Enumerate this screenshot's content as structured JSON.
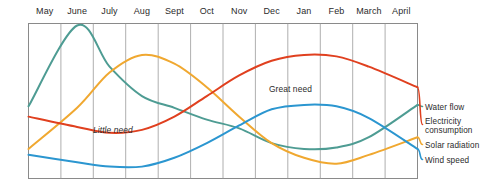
{
  "chart_data": {
    "type": "line",
    "title": "",
    "subtitle": "",
    "xlabel": "",
    "ylabel": "",
    "grid": true,
    "legend_position": "right",
    "axis_ranges": {
      "x": [
        0,
        12
      ],
      "y": [
        0,
        100
      ]
    },
    "categories": [
      "May",
      "June",
      "July",
      "Aug",
      "Sept",
      "Oct",
      "Nov",
      "Dec",
      "Jan",
      "Feb",
      "March",
      "April"
    ],
    "x_tick_labels": [
      "May",
      "June",
      "July",
      "Aug",
      "Sept",
      "Oct",
      "Nov",
      "Dec",
      "Jan",
      "Feb",
      "March",
      "April"
    ],
    "y_tick_labels": [],
    "series": [
      {
        "name": "Water flow",
        "color": "#4e9c93",
        "values": [
          45,
          100,
          72,
          52,
          44,
          36,
          30,
          20,
          16,
          17,
          24,
          46
        ]
      },
      {
        "name": "Electricity consumption",
        "color": "#e0401f",
        "values": [
          38,
          31,
          27,
          29,
          38,
          52,
          66,
          76,
          80,
          79,
          72,
          58
        ]
      },
      {
        "name": "Solar radiation",
        "color": "#f0a830",
        "values": [
          16,
          44,
          68,
          80,
          74,
          58,
          38,
          20,
          10,
          6,
          12,
          24
        ]
      },
      {
        "name": "Wind speed",
        "color": "#2b96d0",
        "values": [
          12,
          7,
          4,
          4,
          10,
          20,
          32,
          43,
          46,
          45,
          37,
          16
        ]
      }
    ],
    "annotations": [
      {
        "text": "Great need",
        "x_category": "Dec",
        "series": "Electricity consumption"
      },
      {
        "text": "Little need",
        "x_category": "July",
        "series": "Electricity consumption"
      }
    ]
  },
  "legend": {
    "items": [
      {
        "label": "Water flow",
        "color": "#4e9c93"
      },
      {
        "label_line1": "Electricity",
        "label_line2": "consumption",
        "color": "#e0401f"
      },
      {
        "label": "Solar radiation",
        "color": "#f0a830"
      },
      {
        "label": "Wind speed",
        "color": "#2b96d0"
      }
    ]
  },
  "annotations": {
    "great_need": "Great need",
    "little_need": "Little need"
  },
  "axis": {
    "months": [
      "May",
      "June",
      "July",
      "Aug",
      "Sept",
      "Oct",
      "Nov",
      "Dec",
      "Jan",
      "Feb",
      "March",
      "April"
    ]
  },
  "colors": {
    "water_flow": "#4e9c93",
    "electricity_consumption": "#e0401f",
    "solar_radiation": "#f0a830",
    "wind_speed": "#2b96d0",
    "grid": "#9a9a9a",
    "frame": "#8a8a8a",
    "text": "#2b2b2b"
  }
}
